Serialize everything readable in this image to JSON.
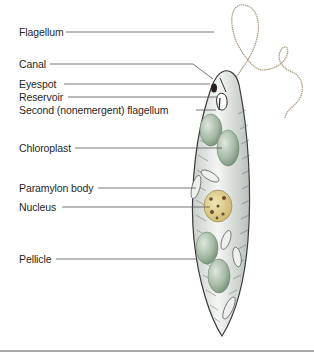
{
  "figure": {
    "labels": [
      {
        "id": "flagellum",
        "text": "Flagellum"
      },
      {
        "id": "canal",
        "text": "Canal"
      },
      {
        "id": "eyespot",
        "text": "Eyespot"
      },
      {
        "id": "reservoir",
        "text": "Reservoir"
      },
      {
        "id": "second-flagellum",
        "text": "Second (nonemergent) flagellum"
      },
      {
        "id": "chloroplast",
        "text": "Chloroplast"
      },
      {
        "id": "paramylon-body",
        "text": "Paramylon body"
      },
      {
        "id": "nucleus",
        "text": "Nucleus"
      },
      {
        "id": "pellicle",
        "text": "Pellicle"
      }
    ]
  },
  "colors": {
    "label_text": "#1f1f1f",
    "leader_line": "#555555",
    "cell_outline": "#3a3a3a",
    "cell_fill": "#e9ecea",
    "chloroplast": "#a9bba9",
    "nucleus": "#d8c98a",
    "flagellum": "#a89a82",
    "rule": "#555555"
  }
}
